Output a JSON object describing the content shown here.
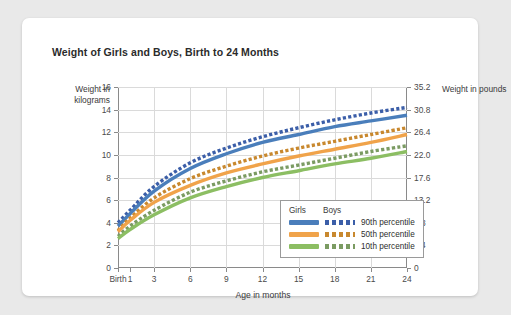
{
  "card": {
    "background": "#ffffff",
    "page_background": "#e9e9e9"
  },
  "chart_data": {
    "type": "line",
    "title": "Weight of Girls and Boys, Birth to 24 Months",
    "xlabel": "Age in months",
    "ylabel": "Weight in kilograms",
    "ylabel_right": "Weight in pounds",
    "grid": true,
    "legend_position": "inside-bottom-right",
    "xlim": [
      0,
      24
    ],
    "ylim": [
      0,
      16
    ],
    "x_tick_positions": [
      0,
      1,
      3,
      6,
      9,
      12,
      15,
      18,
      21,
      24
    ],
    "x_tick_labels": [
      "Birth",
      "1",
      "3",
      "6",
      "9",
      "12",
      "15",
      "18",
      "21",
      "24"
    ],
    "y_ticks": [
      0,
      2,
      4,
      6,
      8,
      10,
      12,
      14,
      16
    ],
    "y_tick_labels": [
      "0",
      "2",
      "4",
      "6",
      "8",
      "10",
      "12",
      "14",
      "16"
    ],
    "y_ticks_right_labels": [
      "0",
      "4.4",
      "8.8",
      "13.2",
      "17.6",
      "22.0",
      "26.4",
      "30.8",
      "35.2"
    ],
    "y_right_range": [
      0,
      35.2
    ],
    "x": [
      0,
      1,
      3,
      6,
      9,
      12,
      15,
      18,
      21,
      24
    ],
    "series": [
      {
        "name": "Boys 90th percentile",
        "group": "Boys",
        "percentile": "90th percentile",
        "color": "#3B5EA8",
        "style": "dotted",
        "values": [
          4.0,
          5.1,
          7.2,
          9.3,
          10.6,
          11.6,
          12.4,
          13.1,
          13.7,
          14.2
        ]
      },
      {
        "name": "Girls 90th percentile",
        "group": "Girls",
        "percentile": "90th percentile",
        "color": "#4A7EBB",
        "style": "solid",
        "values": [
          3.7,
          4.8,
          6.8,
          8.8,
          10.1,
          11.1,
          11.8,
          12.5,
          13.0,
          13.5
        ]
      },
      {
        "name": "Boys 50th percentile",
        "group": "Boys",
        "percentile": "50th percentile",
        "color": "#C8882E",
        "style": "dotted",
        "values": [
          3.3,
          4.4,
          6.2,
          7.9,
          9.0,
          9.9,
          10.6,
          11.2,
          11.8,
          12.4
        ]
      },
      {
        "name": "Girls 50th percentile",
        "group": "Girls",
        "percentile": "50th percentile",
        "color": "#F0A34A",
        "style": "solid",
        "values": [
          3.2,
          4.2,
          5.8,
          7.3,
          8.4,
          9.2,
          9.9,
          10.5,
          11.1,
          11.8
        ]
      },
      {
        "name": "Boys 10th percentile",
        "group": "Boys",
        "percentile": "10th percentile",
        "color": "#7B9B62",
        "style": "dotted",
        "values": [
          2.8,
          3.7,
          5.1,
          6.7,
          7.7,
          8.5,
          9.1,
          9.7,
          10.3,
          10.8
        ]
      },
      {
        "name": "Girls 10th percentile",
        "group": "Girls",
        "percentile": "10th percentile",
        "color": "#8CBE63",
        "style": "solid",
        "values": [
          2.6,
          3.4,
          4.7,
          6.2,
          7.2,
          8.0,
          8.6,
          9.2,
          9.7,
          10.3
        ]
      }
    ],
    "legend": {
      "col1_header": "Girls",
      "col2_header": "Boys",
      "rows": [
        {
          "label": "90th percentile",
          "solid_color": "#4A7EBB",
          "dash_color": "#3B5EA8"
        },
        {
          "label": "50th percentile",
          "solid_color": "#F0A34A",
          "dash_color": "#C8882E"
        },
        {
          "label": "10th percentile",
          "solid_color": "#8CBE63",
          "dash_color": "#7B9B62"
        }
      ]
    }
  }
}
